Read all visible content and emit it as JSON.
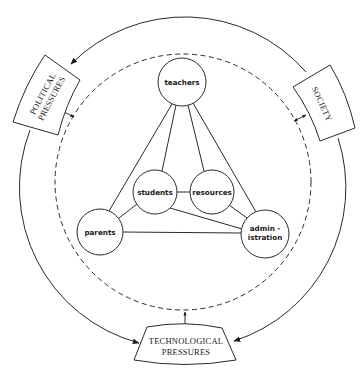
{
  "diagram": {
    "outer_boxes": {
      "political": {
        "line1": "POLITICAL",
        "line2": "PRESSURES"
      },
      "society": {
        "line1": "SOCIETY"
      },
      "technological": {
        "line1": "TECHNOLOGICAL",
        "line2": "PRESSURES"
      }
    },
    "nodes": {
      "teachers": "teachers",
      "students": "students",
      "resources": "resources",
      "parents": "parents",
      "administration_line1": "admin -",
      "administration_line2": "istration"
    },
    "edges": [
      [
        "teachers",
        "parents"
      ],
      [
        "teachers",
        "students"
      ],
      [
        "teachers",
        "resources"
      ],
      [
        "teachers",
        "administration"
      ],
      [
        "students",
        "resources"
      ],
      [
        "students",
        "parents"
      ],
      [
        "students",
        "administration"
      ],
      [
        "resources",
        "administration"
      ],
      [
        "parents",
        "administration"
      ]
    ],
    "colors": {
      "line": "#2a2a2a",
      "background": "#ffffff"
    }
  }
}
